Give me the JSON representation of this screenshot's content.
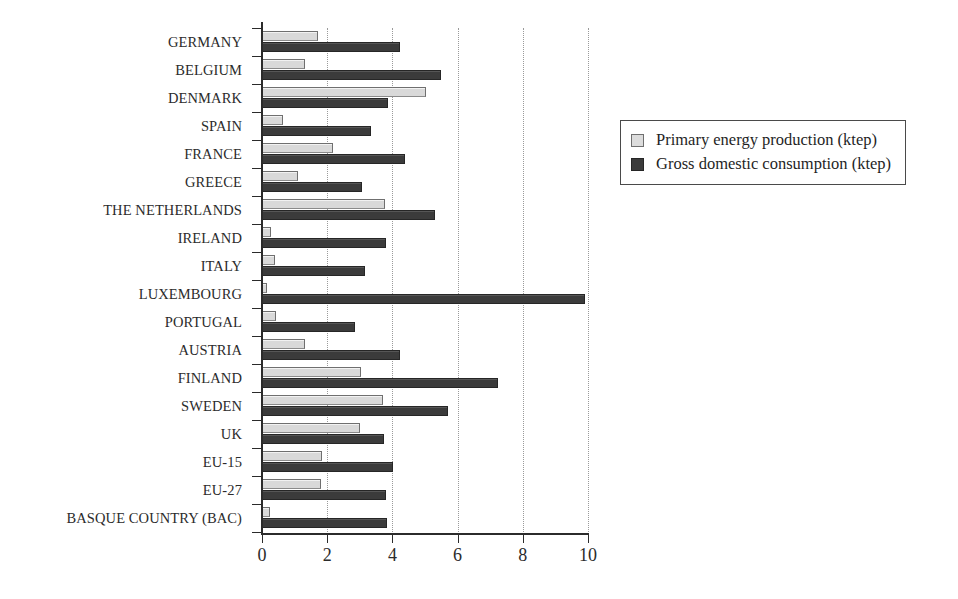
{
  "chart_data": {
    "type": "bar",
    "orientation": "horizontal",
    "title": "",
    "xlabel": "",
    "ylabel": "",
    "xlim": [
      0,
      10
    ],
    "xticks": [
      0,
      2,
      4,
      6,
      8,
      10
    ],
    "xtick_labels": [
      "0",
      "2",
      "4",
      "6",
      "8",
      "10"
    ],
    "grid": true,
    "grid_axis": "x",
    "legend_position": "right",
    "categories": [
      "GERMANY",
      "BELGIUM",
      "DENMARK",
      "SPAIN",
      "FRANCE",
      "GREECE",
      "THE NETHERLANDS",
      "IRELAND",
      "ITALY",
      "LUXEMBOURG",
      "PORTUGAL",
      "AUSTRIA",
      "FINLAND",
      "SWEDEN",
      "UK",
      "EU-15",
      "EU-27",
      "BASQUE COUNTRY (BAC)"
    ],
    "series": [
      {
        "name": "Primary energy production (ktep)",
        "color": "#d9d9d9",
        "values": [
          1.72,
          1.32,
          5.03,
          0.65,
          2.18,
          1.1,
          3.77,
          0.28,
          0.39,
          0.15,
          0.43,
          1.32,
          3.04,
          3.71,
          3.0,
          1.84,
          1.81,
          0.26
        ]
      },
      {
        "name": "Gross domestic consumption (ktep)",
        "color": "#3b3b3b",
        "values": [
          4.23,
          5.49,
          3.87,
          3.35,
          4.4,
          3.07,
          5.31,
          3.8,
          3.16,
          9.91,
          2.85,
          4.23,
          7.24,
          5.71,
          3.74,
          4.02,
          3.8,
          3.83
        ]
      }
    ]
  },
  "legend": {
    "items": [
      {
        "label": "Primary energy production (ktep)",
        "swatch": "light-gray-square"
      },
      {
        "label": "Gross domestic consumption (ktep)",
        "swatch": "dark-gray-square"
      }
    ]
  },
  "colors": {
    "primary_energy_production": "#d9d9d9",
    "gross_domestic_consumption": "#3b3b3b",
    "axis": "#2b2b2b",
    "gridline": "#9a9a9a",
    "background": "#ffffff"
  }
}
